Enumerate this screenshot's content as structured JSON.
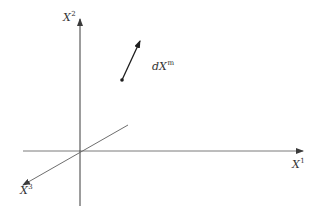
{
  "diagram": {
    "type": "coordinate-axes-3d",
    "origin": {
      "x": 80,
      "y": 151
    },
    "axes": [
      {
        "id": "x1",
        "base": "X",
        "superscript": "1",
        "from": {
          "x": 23,
          "y": 151
        },
        "to": {
          "x": 303,
          "y": 151
        },
        "arrow_at": "end",
        "color": "#7a7a7a",
        "label_pos": {
          "x": 292,
          "y": 158
        }
      },
      {
        "id": "x2",
        "base": "X",
        "superscript": "2",
        "from": {
          "x": 80,
          "y": 206
        },
        "to": {
          "x": 80,
          "y": 19
        },
        "arrow_at": "end",
        "color": "#3a3a3a",
        "label_pos": {
          "x": 63,
          "y": 11
        }
      },
      {
        "id": "x3",
        "base": "X",
        "superscript": "3",
        "from": {
          "x": 128,
          "y": 125
        },
        "to": {
          "x": 23,
          "y": 185
        },
        "arrow_at": "end",
        "color": "#6e6e6e",
        "label_pos": {
          "x": 20,
          "y": 184
        }
      }
    ],
    "vector": {
      "base": "dX",
      "superscript": "m",
      "tail": {
        "x": 122,
        "y": 80
      },
      "head": {
        "x": 140,
        "y": 41
      },
      "color": "#1e1e1e",
      "label_pos": {
        "x": 152,
        "y": 60
      }
    }
  },
  "labels": {
    "x1": {
      "base": "X",
      "sup": "1"
    },
    "x2": {
      "base": "X",
      "sup": "2"
    },
    "x3": {
      "base": "X",
      "sup": "3"
    },
    "vector": {
      "base": "dX",
      "sup": "m"
    }
  }
}
